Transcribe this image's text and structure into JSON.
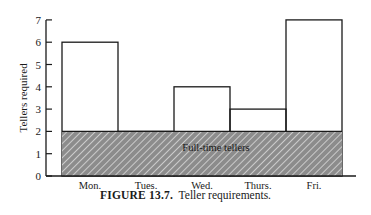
{
  "chart_data": {
    "type": "bar",
    "title": "",
    "xlabel": "",
    "ylabel": "Tellers required",
    "ylim": [
      0,
      7
    ],
    "yticks": [
      0,
      1,
      2,
      3,
      4,
      5,
      6,
      7
    ],
    "grid": false,
    "categories": [
      "Mon.",
      "Tues.",
      "Wed.",
      "Thurs.",
      "Fri."
    ],
    "values": [
      6,
      2,
      4,
      3,
      7
    ],
    "series": [
      {
        "name": "Tellers required",
        "values": [
          6,
          2,
          4,
          3,
          7
        ]
      },
      {
        "name": "Full-time tellers",
        "values": [
          2,
          2,
          2,
          2,
          2
        ],
        "style": "hatched"
      }
    ],
    "annotations": [
      {
        "text": "Full-time tellers",
        "x": "Wed.",
        "y": 1.3
      }
    ]
  },
  "caption": {
    "label": "FIGURE 13.7.",
    "text": "Teller requirements."
  },
  "colors": {
    "axis": "#1a1a1a",
    "bar_fill": "#ffffff",
    "hatch_fill": "#8c8c8c",
    "hatch_line": "#e6e6e6"
  }
}
